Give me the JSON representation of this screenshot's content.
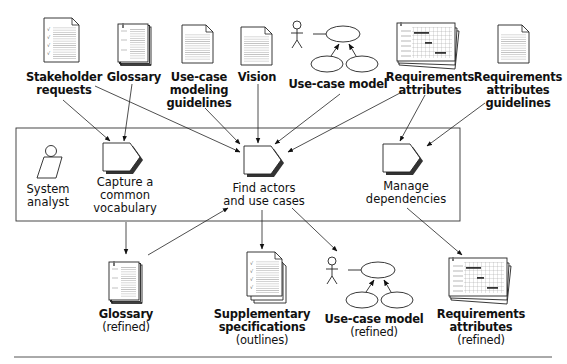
{
  "diagram": {
    "inputs": [
      {
        "id": "stakeholder-requests",
        "lines": [
          "Stakeholder",
          "requests"
        ],
        "icon": "checklist-document-icon"
      },
      {
        "id": "glossary",
        "lines": [
          "Glossary"
        ],
        "icon": "glossary-book-icon"
      },
      {
        "id": "use-case-modeling-guidelines",
        "lines": [
          "Use-case",
          "modeling",
          "guidelines"
        ],
        "icon": "document-icon"
      },
      {
        "id": "vision",
        "lines": [
          "Vision"
        ],
        "icon": "document-icon"
      },
      {
        "id": "use-case-model",
        "lines": [
          "Use-case model"
        ],
        "icon": "use-case-model-icon"
      },
      {
        "id": "requirements-attributes",
        "lines": [
          "Requirements",
          "attributes"
        ],
        "icon": "grid-sheets-icon"
      },
      {
        "id": "requirements-attributes-guidelines",
        "lines": [
          "Requirements",
          "attributes",
          "guidelines"
        ],
        "icon": "document-icon"
      }
    ],
    "workflow": {
      "worker": {
        "lines": [
          "System",
          "analyst"
        ],
        "icon": "worker-icon"
      },
      "activities": [
        {
          "id": "capture-common-vocabulary",
          "lines": [
            "Capture a",
            "common",
            "vocabulary"
          ]
        },
        {
          "id": "find-actors-and-use-cases",
          "lines": [
            "Find actors",
            "and use cases"
          ]
        },
        {
          "id": "manage-dependencies",
          "lines": [
            "Manage",
            "dependencies"
          ]
        }
      ]
    },
    "outputs": [
      {
        "id": "glossary-refined",
        "lines": [
          "Glossary"
        ],
        "sub": [
          "(refined)"
        ],
        "icon": "glossary-book-icon"
      },
      {
        "id": "supplementary-specifications",
        "lines": [
          "Supplementary",
          "specifications"
        ],
        "sub": [
          "(outlines)"
        ],
        "icon": "checklist-stack-icon"
      },
      {
        "id": "use-case-model-refined",
        "lines": [
          "Use-case model"
        ],
        "sub": [
          "(refined)"
        ],
        "icon": "use-case-model-icon"
      },
      {
        "id": "requirements-attributes-refined",
        "lines": [
          "Requirements",
          "attributes"
        ],
        "sub": [
          "(refined)"
        ],
        "icon": "grid-sheets-icon"
      }
    ],
    "colors": {
      "line": "#222222",
      "page": "#ffffff",
      "page_lines": "#9a9a9a",
      "shadow": "#444444"
    }
  }
}
